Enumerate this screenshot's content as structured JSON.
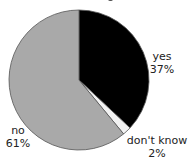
{
  "chart_data": {
    "type": "pie",
    "title": "",
    "categories": [
      "yes",
      "don't know",
      "no"
    ],
    "values": [
      37,
      2,
      61
    ],
    "unit": "%",
    "colors": [
      "#000000",
      "#f2f2f2",
      "#a9a9a9"
    ],
    "start_angle_deg": 90,
    "direction": "clockwise",
    "legend": "none (direct labels)",
    "labels": [
      {
        "name": "yes",
        "value": "37%"
      },
      {
        "name": "don't know",
        "value": "2%"
      },
      {
        "name": "no",
        "value": "61%"
      }
    ]
  }
}
